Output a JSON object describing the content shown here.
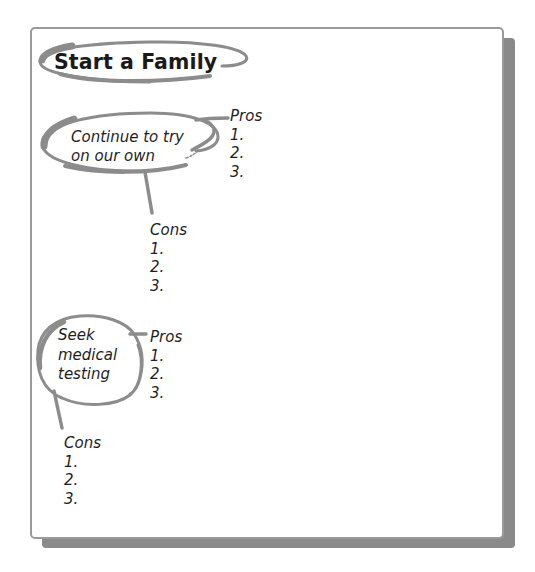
{
  "diagram": {
    "title": "Start a Family",
    "options": [
      {
        "label_line1": "Continue to try",
        "label_line2": "on our own",
        "pros": {
          "heading": "Pros",
          "items": [
            "1.",
            "2.",
            "3."
          ]
        },
        "cons": {
          "heading": "Cons",
          "items": [
            "1.",
            "2.",
            "3."
          ]
        }
      },
      {
        "label_line1": "Seek",
        "label_line2": "medical",
        "label_line3": "testing",
        "pros": {
          "heading": "Pros",
          "items": [
            "1.",
            "2.",
            "3."
          ]
        },
        "cons": {
          "heading": "Cons",
          "items": [
            "1.",
            "2.",
            "3."
          ]
        }
      }
    ]
  },
  "colors": {
    "stroke": "#8c8c8c",
    "border": "#9a9a9a",
    "shadow": "#8a8a8a",
    "text": "#1e1e1e"
  }
}
